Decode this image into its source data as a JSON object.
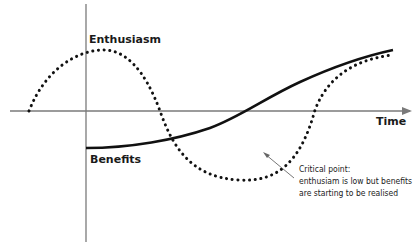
{
  "diagram": {
    "labels": {
      "enthusiasm": "Enthusiasm",
      "benefits": "Benefits",
      "time": "Time"
    },
    "annotation": {
      "lines": [
        "Critical point:",
        "enthusiam is low but benefits",
        "are starting to be realised"
      ]
    },
    "series": [
      {
        "name": "Enthusiasm",
        "style": "dotted",
        "color": "#111111"
      },
      {
        "name": "Benefits",
        "style": "solid",
        "color": "#111111"
      }
    ],
    "axes": {
      "x_label": "Time",
      "axis_color": "#7a7a7a"
    }
  }
}
